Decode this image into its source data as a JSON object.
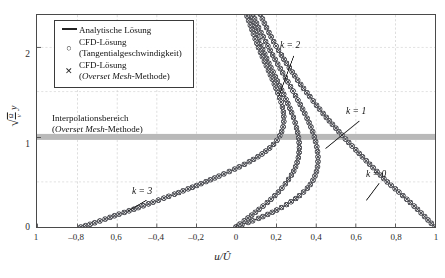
{
  "chart_data": {
    "type": "line",
    "title": "",
    "xlabel": "u/Û",
    "ylabel": "√(Ω/ν)·y",
    "xlim": [
      -1,
      1
    ],
    "ylim": [
      0,
      2.35
    ],
    "grid": true,
    "legend_position": "top-left-inside",
    "xticks": [
      "1",
      "–0,8",
      "0,6",
      "–0,4",
      "–0,2",
      "0",
      "0,2",
      "0,4",
      "0,6",
      "0,8",
      "1"
    ],
    "xtick_values": [
      -1,
      -0.8,
      -0.6,
      -0.4,
      -0.2,
      0,
      0.2,
      0.4,
      0.6,
      0.8,
      1
    ],
    "yticks": [
      "0",
      "1",
      "2"
    ],
    "ytick_values": [
      0,
      1,
      2
    ],
    "series": [
      {
        "name": "k = 0",
        "label": "k = 0",
        "points": [
          [
            1.0,
            0.0
          ],
          [
            0.955,
            0.1
          ],
          [
            0.91,
            0.2
          ],
          [
            0.862,
            0.3
          ],
          [
            0.812,
            0.4
          ],
          [
            0.76,
            0.5
          ],
          [
            0.706,
            0.62
          ],
          [
            0.652,
            0.74
          ],
          [
            0.6,
            0.86
          ],
          [
            0.548,
            0.98
          ],
          [
            0.5,
            1.1
          ],
          [
            0.452,
            1.22
          ],
          [
            0.408,
            1.34
          ],
          [
            0.366,
            1.46
          ],
          [
            0.325,
            1.58
          ],
          [
            0.288,
            1.7
          ],
          [
            0.252,
            1.82
          ],
          [
            0.219,
            1.94
          ],
          [
            0.188,
            2.06
          ],
          [
            0.16,
            2.18
          ],
          [
            0.134,
            2.3
          ],
          [
            0.118,
            2.38
          ]
        ]
      },
      {
        "name": "k = 1",
        "label": "k = 1",
        "points": [
          [
            0.0,
            0.0
          ],
          [
            0.118,
            0.1
          ],
          [
            0.215,
            0.2
          ],
          [
            0.29,
            0.3
          ],
          [
            0.345,
            0.4
          ],
          [
            0.382,
            0.5
          ],
          [
            0.405,
            0.62
          ],
          [
            0.412,
            0.74
          ],
          [
            0.408,
            0.86
          ],
          [
            0.396,
            0.98
          ],
          [
            0.378,
            1.1
          ],
          [
            0.354,
            1.22
          ],
          [
            0.327,
            1.34
          ],
          [
            0.298,
            1.46
          ],
          [
            0.268,
            1.58
          ],
          [
            0.237,
            1.7
          ],
          [
            0.206,
            1.82
          ],
          [
            0.176,
            1.94
          ],
          [
            0.148,
            2.06
          ],
          [
            0.12,
            2.18
          ],
          [
            0.095,
            2.3
          ],
          [
            0.082,
            2.38
          ]
        ]
      },
      {
        "name": "k = 2",
        "label": "k = 2",
        "points": [
          [
            0.0,
            0.0
          ],
          [
            0.06,
            0.1
          ],
          [
            0.118,
            0.2
          ],
          [
            0.172,
            0.3
          ],
          [
            0.218,
            0.4
          ],
          [
            0.255,
            0.5
          ],
          [
            0.29,
            0.62
          ],
          [
            0.31,
            0.74
          ],
          [
            0.318,
            0.86
          ],
          [
            0.315,
            0.98
          ],
          [
            0.304,
            1.1
          ],
          [
            0.288,
            1.22
          ],
          [
            0.266,
            1.34
          ],
          [
            0.242,
            1.46
          ],
          [
            0.216,
            1.58
          ],
          [
            0.19,
            1.7
          ],
          [
            0.164,
            1.82
          ],
          [
            0.14,
            1.94
          ],
          [
            0.116,
            2.06
          ],
          [
            0.094,
            2.18
          ],
          [
            0.074,
            2.3
          ],
          [
            0.062,
            2.38
          ]
        ]
      },
      {
        "name": "k = 3",
        "label": "k = 3",
        "points": [
          [
            -0.78,
            0.0
          ],
          [
            -0.72,
            0.04
          ],
          [
            -0.655,
            0.09
          ],
          [
            -0.585,
            0.145
          ],
          [
            -0.51,
            0.2
          ],
          [
            -0.43,
            0.265
          ],
          [
            -0.345,
            0.335
          ],
          [
            -0.255,
            0.41
          ],
          [
            -0.165,
            0.49
          ],
          [
            -0.075,
            0.575
          ],
          [
            0.01,
            0.66
          ],
          [
            0.088,
            0.75
          ],
          [
            0.152,
            0.845
          ],
          [
            0.2,
            0.945
          ],
          [
            0.228,
            1.05
          ],
          [
            0.24,
            1.16
          ],
          [
            0.238,
            1.275
          ],
          [
            0.226,
            1.39
          ],
          [
            0.208,
            1.5
          ],
          [
            0.186,
            1.62
          ],
          [
            0.162,
            1.74
          ],
          [
            0.138,
            1.86
          ],
          [
            0.115,
            1.98
          ],
          [
            0.094,
            2.1
          ],
          [
            0.075,
            2.22
          ],
          [
            0.058,
            2.32
          ],
          [
            0.05,
            2.38
          ]
        ]
      }
    ],
    "annotations": [
      {
        "text": "k = 2",
        "x": 0.29,
        "y": 1.94,
        "leader_to_x": 0.215,
        "leader_to_y": 1.45
      },
      {
        "text": "k = 1",
        "x": 0.62,
        "y": 1.22,
        "leader_to_x": 0.45,
        "leader_to_y": 0.87
      },
      {
        "text": "k = 3",
        "x": -0.45,
        "y": 0.34,
        "leader_to_x": -0.545,
        "leader_to_y": 0.175
      },
      {
        "text": "k = 0",
        "x": 0.72,
        "y": 0.53,
        "leader_to_x": 0.655,
        "leader_to_y": 0.295
      }
    ],
    "band": {
      "label_line1": "Interpolationsbereich",
      "label_line2_pre": "(",
      "label_line2_italic": "Overset Mesh",
      "label_line2_post": "-Methode)",
      "y_center": 1.0,
      "color": "#b9b9b9"
    }
  },
  "legend": {
    "items": [
      {
        "symbol": "line",
        "line1": "Analytische Lösung",
        "line2": ""
      },
      {
        "symbol": "circle",
        "line1": "CFD-Lösung",
        "line2": "(Tangentialgeschwindigkeit)"
      },
      {
        "symbol": "cross",
        "line1": "CFD-Lösung",
        "line2_pre": "(",
        "line2_italic": "Overset Mesh",
        "line2_post": "-Methode)"
      }
    ]
  },
  "axis": {
    "ylabel_radical": "√",
    "ylabel_num": "Ω",
    "ylabel_den": "ν",
    "ylabel_var": "y",
    "xlabel_num": "u",
    "xlabel_den": "Û"
  },
  "colors": {
    "line": "#2b2b2b",
    "marker": "#55565c",
    "grid": "#c8c8c8",
    "frame": "#4a4a4a",
    "band": "#b9b9b9",
    "background": "#ffffff"
  }
}
